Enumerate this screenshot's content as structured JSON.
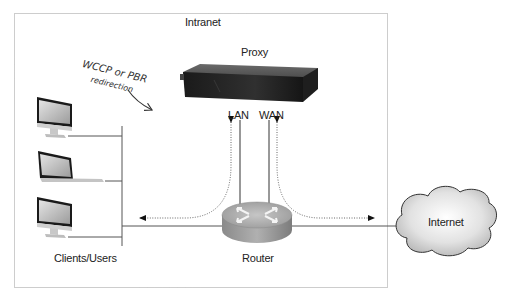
{
  "diagram": {
    "zone": {
      "label": "Intranet",
      "border_color": "#9a9a9a",
      "border_style": "dotted"
    },
    "nodes": {
      "proxy": {
        "label": "Proxy",
        "ports": {
          "lan": "LAN",
          "wan": "WAN"
        }
      },
      "router": {
        "label": "Router"
      },
      "clients": {
        "label": "Clients/Users",
        "devices": [
          "desktop",
          "laptop",
          "desktop"
        ]
      },
      "internet": {
        "label": "Internet"
      }
    },
    "annotation": {
      "line1": "WCCP or PBR",
      "line2": "redirection"
    },
    "edges": [
      {
        "from": "clients",
        "to": "router",
        "style": "solid"
      },
      {
        "from": "router",
        "to": "internet",
        "style": "solid"
      },
      {
        "from": "router",
        "to": "proxy-lan",
        "style": "solid"
      },
      {
        "from": "router",
        "to": "proxy-wan",
        "style": "solid"
      },
      {
        "from": "router-left",
        "to": "proxy-lan",
        "style": "dotted-arrow"
      },
      {
        "from": "router-left",
        "to": "clients",
        "style": "dotted-arrow"
      },
      {
        "from": "router-right",
        "to": "proxy-wan",
        "style": "dotted-arrow"
      },
      {
        "from": "router-right",
        "to": "internet",
        "style": "dotted-arrow"
      }
    ]
  }
}
